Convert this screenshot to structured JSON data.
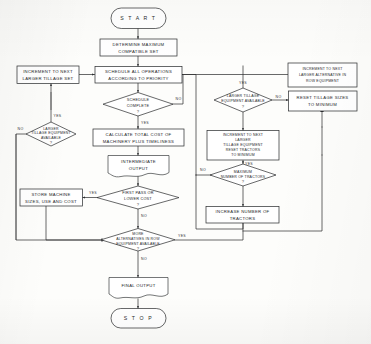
{
  "diagram": {
    "background_color": "#fdfdfb",
    "ink_color": "#2c2e30"
  },
  "nodes": {
    "start": {
      "label": "S T A R T",
      "shape": "terminator"
    },
    "determine_set": {
      "line1": "DETERMINE MAXIMUM",
      "line2": "COMPATIBLE SET",
      "shape": "process"
    },
    "schedule_ops": {
      "line1": "SCHEDULE ALL OPERATIONS",
      "line2": "ACCORDING TO PRIORITY",
      "shape": "process"
    },
    "increment_tillage_set": {
      "line1": "INCREMENT TO NEXT",
      "line2": "LARGER TILLAGE SET",
      "shape": "process"
    },
    "schedule_complete": {
      "line1": "SCHEDULE",
      "line2": "COMPLETE",
      "mark": "?",
      "shape": "decision"
    },
    "larger_tillage_left": {
      "line1": "LARGER",
      "line2": "TILLAGE EQUIPMENT",
      "line3": "AVAILABLE",
      "mark": "?",
      "shape": "decision"
    },
    "calculate_cost": {
      "line1": "CALCULATE TOTAL COST OF",
      "line2": "MACHINERY PLUS TIMELINESS",
      "shape": "process"
    },
    "intermediate_output": {
      "line1": "INTERMEDIATE",
      "line2": "OUTPUT",
      "shape": "document"
    },
    "first_pass": {
      "line1": "FIRST PASS OR",
      "line2": "LOWER COST",
      "mark": "?",
      "shape": "decision"
    },
    "store_machine": {
      "line1": "STORE MACHINE",
      "line2": "SIZES, USE AND COST",
      "shape": "process"
    },
    "more_alternatives": {
      "line1": "MORE",
      "line2": "ALTERNATIVES IN ROW",
      "line3": "EQUIPMENT AVAILABLE",
      "mark": "?",
      "shape": "decision"
    },
    "final_output": {
      "label": "FINAL OUTPUT",
      "shape": "document"
    },
    "stop": {
      "label": "S T O P",
      "shape": "terminator"
    },
    "larger_tillage_right": {
      "line1": "LARGER TILLAGE",
      "line2": "EQUIPMENT AVAILABLE",
      "mark": "?",
      "shape": "decision"
    },
    "increment_tillage_reset": {
      "line1": "INCREMENT TO NEXT",
      "line2": "LARGER",
      "line3": "TILLAGE EQUIPMENT",
      "line4": "RESET TRACTORS",
      "line5": "TO MINIMUM",
      "shape": "process"
    },
    "max_tractors": {
      "line1": "MAXIMUM",
      "line2": "NUMBER OF TRACTORS",
      "mark": "?",
      "shape": "decision"
    },
    "increase_tractors": {
      "line1": "INCREASE NUMBER OF",
      "line2": "TRACTORS",
      "shape": "process"
    },
    "increment_row_equipment": {
      "line1": "INCREMENT TO NEXT",
      "line2": "LARGER ALTERNATIVE IN",
      "line3": "ROW EQUIPMENT",
      "shape": "process"
    },
    "reset_tillage_sizes": {
      "line1": "RESET TILLAGE SIZES",
      "line2": "TO MINIMUM",
      "shape": "process"
    }
  },
  "edge_labels": {
    "schedule_complete_no": "NO",
    "schedule_complete_yes": "YES",
    "larger_tillage_left_yes": "YES",
    "larger_tillage_left_no": "NO",
    "first_pass_yes": "YES",
    "first_pass_no": "NO",
    "more_alternatives_yes": "YES",
    "more_alternatives_no": "NO",
    "larger_tillage_right_yes": "YES",
    "larger_tillage_right_no": "NO",
    "max_tractors_yes": "YES",
    "max_tractors_no": "NO"
  }
}
